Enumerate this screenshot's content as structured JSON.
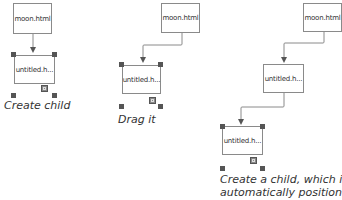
{
  "steps": [
    {
      "parent": {
        "label": "moon.html"
      },
      "child": {
        "label": "untitled.h..."
      },
      "caption": "Create child"
    },
    {
      "parent": {
        "label": "moon.html"
      },
      "child": {
        "label": "untitled.h..."
      },
      "caption": "Drag it"
    },
    {
      "parent": {
        "label": "moon.html"
      },
      "child": {
        "label": "untitled.h..."
      },
      "grandchild": {
        "label": "untitled.h..."
      },
      "caption_line1": "Create a child, which is",
      "caption_line2": "automatically positioned."
    }
  ],
  "colors": {
    "line": "#8a8a8a",
    "handle": "#555555",
    "text": "#333333"
  }
}
